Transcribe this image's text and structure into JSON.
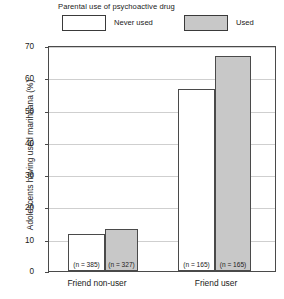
{
  "chart_data": {
    "type": "bar",
    "title": "",
    "xlabel": "",
    "ylabel": "Adolescents having used marihuana (%)",
    "ylim": [
      0,
      70
    ],
    "yticks": [
      0,
      10,
      20,
      30,
      40,
      50,
      60,
      70
    ],
    "grid": true,
    "legend_title": "Parental use of psychoactive drug",
    "legend_position": "above-plot",
    "categories": [
      "Friend non-user",
      "Friend user"
    ],
    "series": [
      {
        "name": "Never used",
        "color": "#ffffff",
        "values": [
          11.5,
          56.5
        ],
        "annotations": [
          "(n = 385)",
          "(n = 165)"
        ]
      },
      {
        "name": "Used",
        "color": "#c8c8c8",
        "values": [
          13.0,
          67.0
        ],
        "annotations": [
          "(n = 327)",
          "(n = 165)"
        ]
      }
    ]
  },
  "axis": {
    "y_title": "Adolescents having used marihuana (%)",
    "y_tick_labels": [
      "70",
      "60",
      "50",
      "40",
      "30",
      "20",
      "10",
      "0"
    ]
  },
  "legend": {
    "title": "Parental use of psychoactive drug",
    "entries": [
      {
        "label": "Never used",
        "swatch": "white-swatch"
      },
      {
        "label": "Used",
        "swatch": "gray-swatch"
      }
    ]
  },
  "groups": [
    {
      "label": "Friend non-user",
      "bars": [
        {
          "series": "Never used",
          "value": 11.5,
          "n_label": "(n = 385)"
        },
        {
          "series": "Used",
          "value": 13.0,
          "n_label": "(n = 327)"
        }
      ]
    },
    {
      "label": "Friend user",
      "bars": [
        {
          "series": "Never used",
          "value": 56.5,
          "n_label": "(n = 165)"
        },
        {
          "series": "Used",
          "value": 67.0,
          "n_label": "(n = 165)"
        }
      ]
    }
  ],
  "colors": {
    "never_used": "#ffffff",
    "used": "#c8c8c8",
    "axis": "#4a4a4a",
    "grid": "#cfcfcf"
  }
}
